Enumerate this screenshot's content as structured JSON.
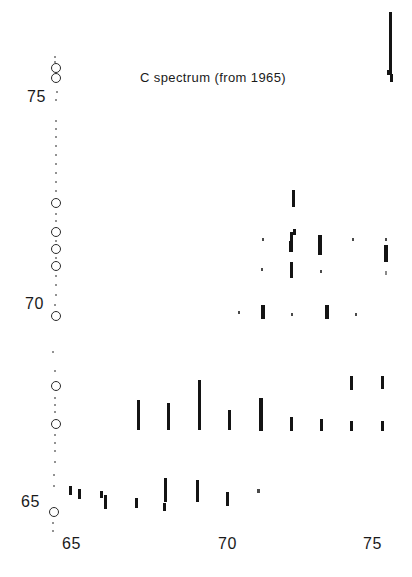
{
  "figure": {
    "title": "C spectrum (from 1965)",
    "title_x": 140,
    "title_y": 71,
    "width": 412,
    "height": 577,
    "background_color": "#ffffff",
    "ink_color": "#141414"
  },
  "axes": {
    "x_label_left": "65",
    "x_label_mid": "70",
    "x_label_right": "75",
    "y_label_top": "75",
    "y_label_mid": "70",
    "y_label_bottom": "65",
    "x_ticks": [
      {
        "label": "65",
        "x": 62,
        "y": 536
      },
      {
        "label": "70",
        "x": 218,
        "y": 536
      },
      {
        "label": "75",
        "x": 363,
        "y": 536
      }
    ],
    "y_ticks": [
      {
        "label": "75",
        "x": 27,
        "y": 89
      },
      {
        "label": "70",
        "x": 25,
        "y": 296
      },
      {
        "label": "65",
        "x": 21,
        "y": 494
      }
    ]
  },
  "chart_data": {
    "type": "scatter",
    "title": "C spectrum (from 1965)",
    "xlabel": "",
    "ylabel": "",
    "xlim": [
      64.2,
      76.2
    ],
    "ylim": [
      64.5,
      76.5
    ],
    "grid": false,
    "legend": null,
    "reference_line": {
      "name": "diagonal-reference-markers",
      "style": "open circles with interleaved dots",
      "circles": [
        {
          "x": 56,
          "y": 68,
          "r": 5
        },
        {
          "x": 56,
          "y": 78,
          "r": 5
        },
        {
          "x": 56,
          "y": 203,
          "r": 5
        },
        {
          "x": 56,
          "y": 232,
          "r": 5
        },
        {
          "x": 56,
          "y": 249,
          "r": 5
        },
        {
          "x": 56,
          "y": 266,
          "r": 5
        },
        {
          "x": 56,
          "y": 316,
          "r": 5
        },
        {
          "x": 56,
          "y": 386,
          "r": 5
        },
        {
          "x": 56,
          "y": 424,
          "r": 5
        },
        {
          "x": 54,
          "y": 512,
          "r": 5
        }
      ],
      "dots": [
        {
          "x": 55,
          "y": 57,
          "r": 1.1
        },
        {
          "x": 55,
          "y": 62,
          "r": 1.0
        },
        {
          "x": 57,
          "y": 92,
          "r": 1.1
        },
        {
          "x": 56,
          "y": 100,
          "r": 1.0
        },
        {
          "x": 56,
          "y": 121,
          "r": 1.0
        },
        {
          "x": 56,
          "y": 129,
          "r": 1.0
        },
        {
          "x": 56,
          "y": 137,
          "r": 1.0
        },
        {
          "x": 56,
          "y": 146,
          "r": 1.0
        },
        {
          "x": 56,
          "y": 155,
          "r": 1.0
        },
        {
          "x": 56,
          "y": 164,
          "r": 1.0
        },
        {
          "x": 56,
          "y": 173,
          "r": 1.0
        },
        {
          "x": 56,
          "y": 182,
          "r": 1.1
        },
        {
          "x": 56,
          "y": 191,
          "r": 1.1
        },
        {
          "x": 56,
          "y": 214,
          "r": 1.1
        },
        {
          "x": 56,
          "y": 221,
          "r": 1.1
        },
        {
          "x": 56,
          "y": 241,
          "r": 1.1
        },
        {
          "x": 56,
          "y": 258,
          "r": 1.1
        },
        {
          "x": 56,
          "y": 276,
          "r": 1.1
        },
        {
          "x": 56,
          "y": 285,
          "r": 1.1
        },
        {
          "x": 56,
          "y": 295,
          "r": 1.1
        },
        {
          "x": 55,
          "y": 305,
          "r": 1.1
        },
        {
          "x": 53,
          "y": 352,
          "r": 1.1
        },
        {
          "x": 55,
          "y": 371,
          "r": 1.1
        },
        {
          "x": 55,
          "y": 398,
          "r": 1.1
        },
        {
          "x": 55,
          "y": 405,
          "r": 1.1
        },
        {
          "x": 55,
          "y": 412,
          "r": 1.1
        },
        {
          "x": 55,
          "y": 435,
          "r": 1.1
        },
        {
          "x": 55,
          "y": 443,
          "r": 1.1
        },
        {
          "x": 55,
          "y": 451,
          "r": 1.1
        },
        {
          "x": 55,
          "y": 462,
          "r": 1.1
        },
        {
          "x": 54,
          "y": 475,
          "r": 1.2
        },
        {
          "x": 54,
          "y": 486,
          "r": 1.2
        },
        {
          "x": 53,
          "y": 523,
          "r": 1.2
        },
        {
          "x": 53,
          "y": 531,
          "r": 1.2
        }
      ]
    },
    "marks": [
      {
        "x": 389,
        "y": 12,
        "w": 3.4,
        "h": 60,
        "tone": "dark"
      },
      {
        "x": 387,
        "y": 70,
        "w": 5.2,
        "h": 5,
        "tone": "dark"
      },
      {
        "x": 390,
        "y": 74,
        "w": 3.4,
        "h": 8,
        "tone": "dark"
      },
      {
        "x": 292,
        "y": 190,
        "w": 3.2,
        "h": 17,
        "tone": "dark"
      },
      {
        "x": 262,
        "y": 238,
        "w": 2.2,
        "h": 3,
        "tone": "faint"
      },
      {
        "x": 290,
        "y": 232,
        "w": 3.4,
        "h": 9,
        "tone": "dark"
      },
      {
        "x": 293,
        "y": 229,
        "w": 2.6,
        "h": 6,
        "tone": "dark"
      },
      {
        "x": 289,
        "y": 241,
        "w": 3.8,
        "h": 11,
        "tone": "dark"
      },
      {
        "x": 318,
        "y": 235,
        "w": 3.6,
        "h": 20,
        "tone": "dark"
      },
      {
        "x": 352,
        "y": 238,
        "w": 2.4,
        "h": 3,
        "tone": "faint"
      },
      {
        "x": 385,
        "y": 238,
        "w": 2.4,
        "h": 3,
        "tone": "faint"
      },
      {
        "x": 384,
        "y": 245,
        "w": 3.6,
        "h": 17,
        "tone": "dark"
      },
      {
        "x": 261,
        "y": 268,
        "w": 2.4,
        "h": 3,
        "tone": "faint"
      },
      {
        "x": 290,
        "y": 262,
        "w": 3.4,
        "h": 16,
        "tone": "dark"
      },
      {
        "x": 320,
        "y": 270,
        "w": 2.4,
        "h": 3,
        "tone": "faint"
      },
      {
        "x": 385,
        "y": 271,
        "w": 2.2,
        "h": 4,
        "tone": "vfaint"
      },
      {
        "x": 238,
        "y": 311,
        "w": 2.4,
        "h": 3,
        "tone": "faint"
      },
      {
        "x": 261,
        "y": 305,
        "w": 3.6,
        "h": 14,
        "tone": "dark"
      },
      {
        "x": 291,
        "y": 313,
        "w": 2.4,
        "h": 3,
        "tone": "faint"
      },
      {
        "x": 325,
        "y": 305,
        "w": 3.6,
        "h": 14,
        "tone": "dark"
      },
      {
        "x": 355,
        "y": 313,
        "w": 2.4,
        "h": 3,
        "tone": "faint"
      },
      {
        "x": 137,
        "y": 400,
        "w": 3.4,
        "h": 30,
        "tone": "dark"
      },
      {
        "x": 167,
        "y": 403,
        "w": 3.4,
        "h": 27,
        "tone": "dark"
      },
      {
        "x": 198,
        "y": 380,
        "w": 3.4,
        "h": 50,
        "tone": "dark"
      },
      {
        "x": 228,
        "y": 410,
        "w": 3.2,
        "h": 20,
        "tone": "dark"
      },
      {
        "x": 259,
        "y": 398,
        "w": 3.8,
        "h": 33,
        "tone": "dark"
      },
      {
        "x": 290,
        "y": 417,
        "w": 3.2,
        "h": 14,
        "tone": "dark"
      },
      {
        "x": 320,
        "y": 419,
        "w": 3.0,
        "h": 12,
        "tone": "dark"
      },
      {
        "x": 350,
        "y": 376,
        "w": 3.2,
        "h": 14,
        "tone": "dark"
      },
      {
        "x": 350,
        "y": 421,
        "w": 2.8,
        "h": 10,
        "tone": "dark"
      },
      {
        "x": 381,
        "y": 376,
        "w": 3.2,
        "h": 13,
        "tone": "dark"
      },
      {
        "x": 381,
        "y": 421,
        "w": 2.8,
        "h": 10,
        "tone": "dark"
      },
      {
        "x": 69,
        "y": 486,
        "w": 3.2,
        "h": 9,
        "tone": "dark"
      },
      {
        "x": 78,
        "y": 489,
        "w": 3.2,
        "h": 10,
        "tone": "dark"
      },
      {
        "x": 100,
        "y": 491,
        "w": 2.8,
        "h": 7,
        "tone": "dark"
      },
      {
        "x": 104,
        "y": 495,
        "w": 3.2,
        "h": 14,
        "tone": "dark"
      },
      {
        "x": 135,
        "y": 498,
        "w": 3.0,
        "h": 10,
        "tone": "dark"
      },
      {
        "x": 164,
        "y": 478,
        "w": 3.4,
        "h": 24,
        "tone": "dark"
      },
      {
        "x": 163,
        "y": 503,
        "w": 3.0,
        "h": 8,
        "tone": "dark"
      },
      {
        "x": 196,
        "y": 480,
        "w": 3.4,
        "h": 22,
        "tone": "dark"
      },
      {
        "x": 226,
        "y": 492,
        "w": 3.0,
        "h": 14,
        "tone": "dark"
      },
      {
        "x": 257,
        "y": 489,
        "w": 2.6,
        "h": 4,
        "tone": "faint"
      }
    ]
  }
}
